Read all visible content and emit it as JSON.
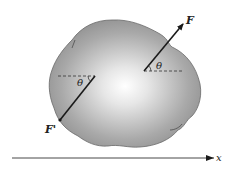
{
  "figure": {
    "force_label": "F",
    "reaction_label": "F'",
    "angle_label_right": "θ",
    "angle_label_left": "θ",
    "axis_label": "x"
  },
  "colors": {
    "body_edge": "#6e6e6e",
    "body_center": "#ffffff",
    "line": "#1a1a1a"
  }
}
